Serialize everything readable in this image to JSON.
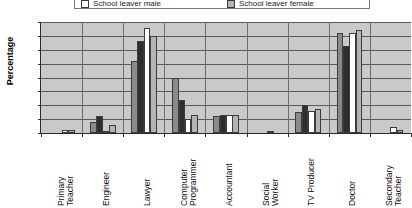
{
  "chart_data": {
    "type": "bar",
    "title": "",
    "xlabel": "",
    "ylabel": "Percentage",
    "ylim": [
      0,
      40
    ],
    "ytick_step": 5,
    "yticks": [
      40,
      35,
      30,
      25,
      20,
      15,
      10,
      5,
      0
    ],
    "grid": true,
    "legend_position": "top",
    "categories": [
      "Primary Teacher",
      "Engineer",
      "Lawyer",
      "Computer Programmer",
      "Accountant",
      "Social Worker",
      "TV Producer",
      "Doctor",
      "Secondary Teacher"
    ],
    "category_lines": [
      [
        "Primary",
        "Teacher"
      ],
      [
        "Engineer"
      ],
      [
        "Lawyer"
      ],
      [
        "Computer",
        "Programmer"
      ],
      [
        "Accountant"
      ],
      [
        "Social",
        "Worker"
      ],
      [
        "TV Producer"
      ],
      [
        "Doctor"
      ],
      [
        "Secondary",
        "Teacher"
      ]
    ],
    "series": [
      {
        "name": "series-1",
        "color": "#8a8a8a",
        "values": [
          0,
          4,
          26,
          20,
          6,
          0,
          7.5,
          36,
          0
        ]
      },
      {
        "name": "series-2",
        "color": "#2e2e2e",
        "values": [
          0,
          6,
          33,
          12,
          6.5,
          0,
          10,
          31.5,
          0
        ]
      },
      {
        "name": "School leaver male",
        "color": "#ffffff",
        "values": [
          1,
          0.3,
          38,
          5,
          6.5,
          0.8,
          8,
          36,
          2
        ]
      },
      {
        "name": "School leaver female",
        "color": "#b4b4b4",
        "values": [
          1,
          3,
          35,
          6.5,
          6.5,
          0,
          8.5,
          37,
          1
        ]
      }
    ]
  },
  "legend": {
    "entries": [
      {
        "label": "School leaver male",
        "color": "#ffffff"
      },
      {
        "label": "School leaver female",
        "color": "#b4b4b4"
      }
    ]
  }
}
